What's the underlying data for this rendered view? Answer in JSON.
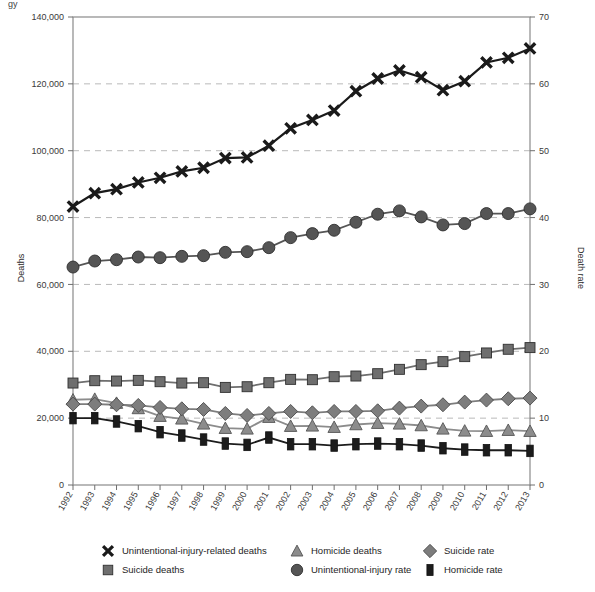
{
  "figure": {
    "clipped_top_text": "gy",
    "background_color": "#ffffff"
  },
  "axes": {
    "left": {
      "title": "Deaths",
      "ticks": [
        "0",
        "20,000",
        "40,000",
        "60,000",
        "80,000",
        "100,000",
        "120,000",
        "140,000"
      ],
      "min": 0,
      "max": 140000,
      "step": 20000
    },
    "right": {
      "title": "Death rate",
      "ticks": [
        "0",
        "10",
        "20",
        "30",
        "40",
        "50",
        "60",
        "70"
      ],
      "min": 0,
      "max": 70,
      "step": 10
    },
    "bottom": {
      "title": "",
      "ticks": [
        "1992",
        "1993",
        "1994",
        "1995",
        "1996",
        "1997",
        "1998",
        "1999",
        "2000",
        "2001",
        "2002",
        "2003",
        "2004",
        "2005",
        "2006",
        "2007",
        "2008",
        "2009",
        "2010",
        "2011",
        "2012",
        "2013"
      ]
    }
  },
  "legend": {
    "entries": [
      {
        "label": "Unintentional-injury-related deaths",
        "marker": "x-marker-icon",
        "color": "#1a1a1a"
      },
      {
        "label": "Homicide deaths",
        "marker": "triangle-marker-icon",
        "color": "#8c8c8c"
      },
      {
        "label": "Suicide rate",
        "marker": "diamond-marker-icon",
        "color": "#7d7d7d"
      },
      {
        "label": "Suicide deaths",
        "marker": "square-marker-icon",
        "color": "#6e6e6e"
      },
      {
        "label": "Unintentional-injury rate",
        "marker": "circle-marker-icon",
        "color": "#555555"
      },
      {
        "label": "Homicide rate",
        "marker": "bar-marker-icon",
        "color": "#1c1c1c"
      }
    ]
  },
  "chart_data": {
    "type": "line",
    "title": "",
    "subtitle": "",
    "xlabel": "",
    "ylabel": "Deaths",
    "y2label": "Death rate",
    "xlim": [
      1992,
      2013
    ],
    "ylim": [
      0,
      140000
    ],
    "y2lim": [
      0,
      70
    ],
    "grid": true,
    "grid_axis": "y",
    "legend_position": "bottom",
    "x": [
      "1992",
      "1993",
      "1994",
      "1995",
      "1996",
      "1997",
      "1998",
      "1999",
      "2000",
      "2001",
      "2002",
      "2003",
      "2004",
      "2005",
      "2006",
      "2007",
      "2008",
      "2009",
      "2010",
      "2011",
      "2012",
      "2013"
    ],
    "series": [
      {
        "name": "Unintentional-injury-related deaths",
        "axis": "left",
        "marker": "x",
        "color": "#1a1a1a",
        "values": [
          83300,
          87300,
          88500,
          90500,
          91900,
          93800,
          94900,
          97800,
          98000,
          101500,
          106700,
          109200,
          112000,
          117800,
          121600,
          124000,
          122000,
          118100,
          120800,
          126400,
          127800,
          130600
        ]
      },
      {
        "name": "Suicide deaths",
        "axis": "left",
        "marker": "square",
        "color": "#6e6e6e",
        "values": [
          30500,
          31200,
          31100,
          31300,
          30900,
          30500,
          30600,
          29200,
          29400,
          30600,
          31600,
          31500,
          32400,
          32600,
          33300,
          34600,
          36000,
          36900,
          38400,
          39500,
          40600,
          41100
        ]
      },
      {
        "name": "Homicide deaths",
        "axis": "left",
        "marker": "triangle",
        "color": "#8c8c8c",
        "values": [
          25500,
          25700,
          24500,
          22900,
          20600,
          19800,
          18300,
          17000,
          16800,
          20300,
          17600,
          17700,
          17300,
          18100,
          18500,
          18300,
          17800,
          16800,
          16200,
          16100,
          16400,
          16100
        ]
      },
      {
        "name": "Unintentional-injury rate",
        "axis": "right",
        "marker": "circle",
        "color": "#555555",
        "values": [
          32.6,
          33.5,
          33.7,
          34.1,
          34.0,
          34.2,
          34.3,
          34.8,
          34.9,
          35.5,
          37.0,
          37.6,
          38.1,
          39.3,
          40.5,
          41.0,
          40.1,
          38.9,
          39.1,
          40.6,
          40.6,
          41.3
        ]
      },
      {
        "name": "Suicide rate",
        "axis": "right",
        "marker": "diamond",
        "color": "#7d7d7d",
        "values": [
          12.1,
          12.1,
          12.0,
          11.9,
          11.6,
          11.4,
          11.3,
          10.7,
          10.4,
          10.7,
          11.0,
          10.8,
          11.0,
          11.0,
          11.1,
          11.5,
          11.8,
          12.0,
          12.4,
          12.7,
          12.9,
          13.0
        ]
      },
      {
        "name": "Homicide rate",
        "axis": "right",
        "marker": "bar",
        "color": "#1c1c1c",
        "values": [
          10.0,
          10.0,
          9.5,
          8.8,
          7.9,
          7.4,
          6.8,
          6.2,
          6.0,
          7.1,
          6.1,
          6.1,
          5.9,
          6.1,
          6.2,
          6.1,
          5.9,
          5.5,
          5.3,
          5.2,
          5.2,
          5.1
        ]
      }
    ]
  }
}
